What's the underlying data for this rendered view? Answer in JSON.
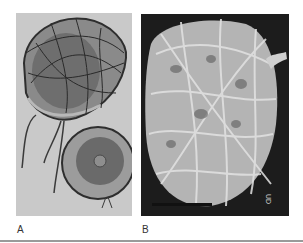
{
  "figure": {
    "panels": [
      {
        "id": "A",
        "label": "A",
        "kind": "drawing",
        "description": "Illustration of two encapsulated cells wrapped in fibers, with trailing flagella-like strands"
      },
      {
        "id": "B",
        "label": "B",
        "kind": "micrograph",
        "description": "Scanning electron micrograph of a cell covered by a fibrous mesh",
        "scale_bar": true,
        "corner_text": "UD"
      }
    ]
  },
  "colors": {
    "panel_a_bg": "#c9c9c9",
    "panel_b_bg": "#1c1c1c",
    "rule": "#9a9a9a"
  }
}
